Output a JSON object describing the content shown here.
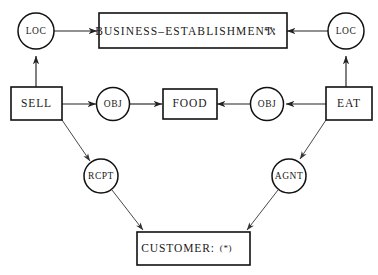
{
  "diagram": {
    "background_color": "#ffffff",
    "stroke_color": "#111111",
    "text_color": "#1a1a1a",
    "nodes": {
      "business_establishment": {
        "label": "BUSINESS–ESTABLISHMENT:",
        "suffix": "*X",
        "shape": "box"
      },
      "customer": {
        "label": "CUSTOMER:",
        "suffix": "(*)",
        "shape": "box"
      },
      "sell": {
        "label": "SELL",
        "shape": "box"
      },
      "eat": {
        "label": "EAT",
        "shape": "box"
      },
      "food": {
        "label": "FOOD",
        "shape": "box"
      },
      "loc_left": {
        "label": "LOC",
        "shape": "circle"
      },
      "loc_right": {
        "label": "LOC",
        "shape": "circle"
      },
      "obj_left": {
        "label": "OBJ",
        "shape": "circle"
      },
      "obj_right": {
        "label": "OBJ",
        "shape": "circle"
      },
      "rcpt": {
        "label": "RCPT",
        "shape": "circle"
      },
      "agnt": {
        "label": "AGNT",
        "shape": "circle"
      }
    },
    "edges": [
      {
        "from": "sell",
        "to": "loc_left",
        "arrow": "to"
      },
      {
        "from": "loc_left",
        "to": "business_establishment",
        "arrow": "to"
      },
      {
        "from": "eat",
        "to": "loc_right",
        "arrow": "to"
      },
      {
        "from": "loc_right",
        "to": "business_establishment",
        "arrow": "to"
      },
      {
        "from": "sell",
        "to": "obj_left",
        "arrow": "to"
      },
      {
        "from": "obj_left",
        "to": "food",
        "arrow": "to"
      },
      {
        "from": "eat",
        "to": "obj_right",
        "arrow": "to"
      },
      {
        "from": "obj_right",
        "to": "food",
        "arrow": "to"
      },
      {
        "from": "sell",
        "to": "rcpt",
        "arrow": "to"
      },
      {
        "from": "rcpt",
        "to": "customer",
        "arrow": "to"
      },
      {
        "from": "eat",
        "to": "agnt",
        "arrow": "to"
      },
      {
        "from": "agnt",
        "to": "customer",
        "arrow": "to"
      }
    ]
  }
}
